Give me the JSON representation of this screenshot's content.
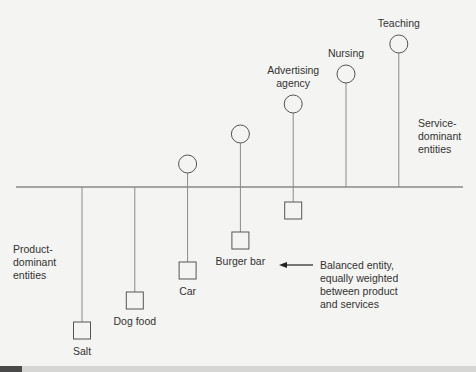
{
  "diagram": {
    "title": "",
    "product_group_label": [
      "Product-",
      "dominant",
      "entities"
    ],
    "service_group_label": [
      "Service-",
      "dominant",
      "entities"
    ],
    "balanced_note": [
      "Balanced entity,",
      "equally weighted",
      "between product",
      "and services"
    ],
    "balanced_note_target": "Burger bar",
    "entities": [
      {
        "name": "Salt",
        "product_level": 5,
        "service_level": 0,
        "label_position": "below"
      },
      {
        "name": "Dog food",
        "product_level": 4,
        "service_level": 0,
        "label_position": "below"
      },
      {
        "name": "Car",
        "product_level": 3,
        "service_level": 1,
        "label_position": "below"
      },
      {
        "name": "Burger bar",
        "product_level": 2,
        "service_level": 2,
        "label_position": "below"
      },
      {
        "name": "Advertising agency",
        "label_lines": [
          "Advertising",
          "agency"
        ],
        "product_level": 1,
        "service_level": 3,
        "label_position": "above"
      },
      {
        "name": "Nursing",
        "product_level": 0,
        "service_level": 4,
        "label_position": "above"
      },
      {
        "name": "Teaching",
        "product_level": 0,
        "service_level": 5,
        "label_position": "above"
      }
    ],
    "legend": {
      "square": "product component",
      "circle": "service component"
    },
    "colors": {
      "line": "#8a8a8a",
      "axis": "#555555",
      "shape_stroke": "#555555",
      "text": "#333333",
      "background": "#f4f4f2"
    }
  }
}
